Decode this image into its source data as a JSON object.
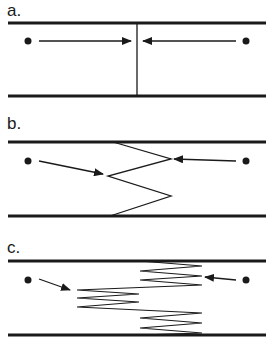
{
  "panels": [
    {
      "label": "a.",
      "description": "Two points with arrows converging on a single straight vertical boundary"
    },
    {
      "label": "b.",
      "description": "Two points with arrows converging on a zigzag boundary with one fold"
    },
    {
      "label": "c.",
      "description": "Two points with arrows converging on a highly folded zigzag boundary"
    }
  ],
  "colors": {
    "line": "#1a1a1a",
    "background": "#ffffff"
  }
}
